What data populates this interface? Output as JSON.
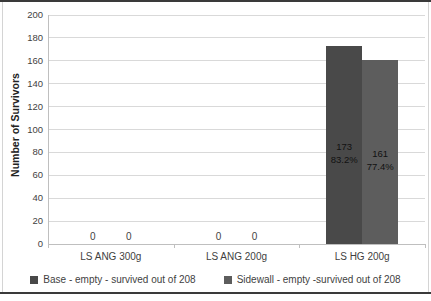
{
  "chart_data": {
    "type": "bar",
    "title": "",
    "xlabel": "",
    "ylabel": "Number of Survivors",
    "ylim": [
      0,
      200
    ],
    "ytick_step": 20,
    "grid": true,
    "legend_position": "bottom",
    "categories": [
      "LS ANG 300g",
      "LS ANG 200g",
      "LS HG 200g"
    ],
    "series": [
      {
        "name": "Base - empty - survived out of 208",
        "color": "#494949",
        "values": [
          0,
          0,
          173
        ],
        "data_labels": [
          "0",
          "0",
          "173\n83.2%"
        ]
      },
      {
        "name": "Sidewall - empty -survived out of 208",
        "color": "#5d5d5d",
        "values": [
          0,
          0,
          161
        ],
        "data_labels": [
          "0",
          "0",
          "161\n77.4%"
        ]
      }
    ],
    "style_colors": {
      "gridline": "#d9d9d9",
      "axis": "#bfbfbf",
      "text": "#3f3f3f",
      "background": "#ffffff"
    }
  }
}
